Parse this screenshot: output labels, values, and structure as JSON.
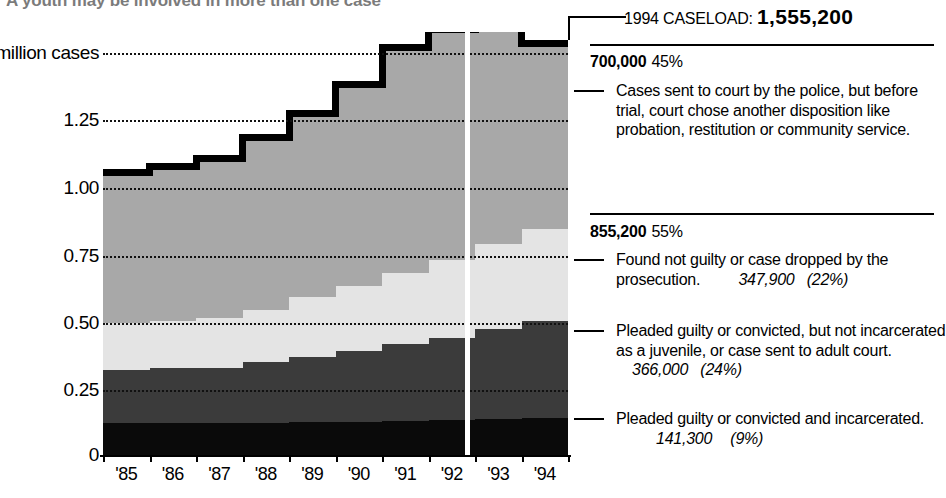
{
  "headline": "A youth may be involved in more than one case",
  "chart_data": {
    "type": "area",
    "ylabel": "million cases",
    "xlabel": "",
    "ylim": [
      0,
      1.6
    ],
    "grid": true,
    "legend_position": "right-annotations",
    "categories": [
      "'85",
      "'86",
      "'87",
      "'88",
      "'89",
      "'90",
      "'91",
      "'92",
      "'93",
      "'94"
    ],
    "ytick_labels": [
      "1.50 million cases",
      "1.25",
      "1.00",
      "0.75",
      "0.50",
      "0.25",
      "0"
    ],
    "ytick_values": [
      1.5,
      1.25,
      1.0,
      0.75,
      0.5,
      0.25,
      0
    ],
    "stack_order_bottom_to_top": [
      "incarcerated",
      "convicted-not-incarcerated",
      "not-guilty-or-dropped",
      "sent-to-court-other-disposition"
    ],
    "series": [
      {
        "name": "Pleaded guilty or convicted and incarcerated.",
        "key": "incarcerated",
        "color": "#0a0a0a",
        "values": [
          0.12,
          0.12,
          0.12,
          0.122,
          0.124,
          0.126,
          0.13,
          0.134,
          0.138,
          0.141
        ]
      },
      {
        "name": "Pleaded guilty or convicted, but not incarcerated as a juvenile, or case sent to adult court.",
        "key": "convicted-not-incarcerated",
        "color": "#3b3b3b",
        "values": [
          0.2,
          0.208,
          0.208,
          0.228,
          0.248,
          0.268,
          0.289,
          0.31,
          0.34,
          0.366
        ]
      },
      {
        "name": "Found not guilty or case dropped by the prosecution.",
        "key": "not-guilty-or-dropped",
        "color": "#e4e4e4",
        "values": [
          0.18,
          0.18,
          0.19,
          0.2,
          0.225,
          0.245,
          0.268,
          0.292,
          0.32,
          0.348
        ]
      },
      {
        "name": "Cases sent to court by the police, but before trial, court chose another disposition like probation, restitution or community service.",
        "key": "sent-to-court-other-disposition",
        "color": "#a8a8a8",
        "values": [
          0.57,
          0.582,
          0.602,
          0.65,
          0.693,
          0.761,
          0.853,
          0.874,
          0.902,
          0.7
        ]
      }
    ],
    "totals": [
      1.07,
      1.09,
      1.12,
      1.2,
      1.29,
      1.4,
      1.54,
      1.61,
      1.7,
      1.555
    ]
  },
  "annotations": {
    "caseload_label": "1994 CASELOAD:",
    "caseload_value": "1,555,200",
    "blocks": [
      {
        "value": "700,000",
        "percent": "45%",
        "text": "Cases sent to court by the police, but before trial, court chose another disposition like probation, restitution or community service.",
        "detail_number": "",
        "detail_percent": ""
      },
      {
        "value": "855,200",
        "percent": "55%",
        "text": "Found not guilty or case dropped by the prosecution.",
        "detail_number": "347,900",
        "detail_percent": "(22%)"
      },
      {
        "value": "",
        "percent": "",
        "text": "Pleaded guilty or convicted, but not incarcerated as a juvenile, or case sent to adult court.",
        "detail_number": "366,000",
        "detail_percent": "(24%)"
      },
      {
        "value": "",
        "percent": "",
        "text": "Pleaded guilty or convicted and incarcerated.",
        "detail_number": "141,300",
        "detail_percent": "(9%)"
      }
    ]
  }
}
